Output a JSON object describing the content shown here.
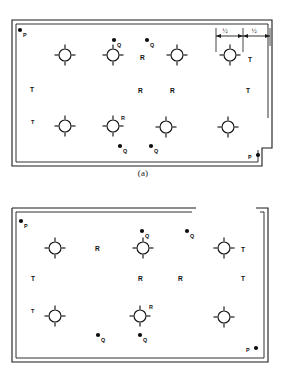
{
  "figure": {
    "panels": [
      {
        "id": "a",
        "caption": "(a)",
        "sprinkler_rows": 2,
        "sprinklers_per_row": 4,
        "wall_style": "double-line closed with bottom-right notch",
        "dimensions": [
          {
            "label": "½",
            "id": "dim-half-left"
          },
          {
            "label": "½",
            "id": "dim-half-right"
          }
        ],
        "point_labels": [
          {
            "text": "P",
            "kind": "dot-label",
            "x": 20,
            "y": 30
          },
          {
            "text": "Q",
            "kind": "dot-label",
            "x": 114,
            "y": 40
          },
          {
            "text": "Q",
            "kind": "dot-label",
            "x": 147,
            "y": 40
          },
          {
            "text": "R",
            "kind": "plain",
            "x": 140,
            "y": 58
          },
          {
            "text": "T",
            "kind": "plain",
            "x": 248,
            "y": 60
          },
          {
            "text": "T",
            "kind": "plain",
            "x": 32,
            "y": 90
          },
          {
            "text": "R",
            "kind": "plain",
            "x": 140,
            "y": 91
          },
          {
            "text": "R",
            "kind": "plain",
            "x": 172,
            "y": 91
          },
          {
            "text": "T",
            "kind": "plain",
            "x": 248,
            "y": 91
          },
          {
            "text": "T",
            "kind": "plain",
            "x": 33,
            "y": 122
          },
          {
            "text": "R",
            "kind": "plain",
            "x": 122,
            "y": 118
          },
          {
            "text": "Q",
            "kind": "dot-label",
            "x": 120,
            "y": 146
          },
          {
            "text": "Q",
            "kind": "dot-label",
            "x": 151,
            "y": 146
          },
          {
            "text": "P",
            "kind": "dot-label-right",
            "x": 252,
            "y": 158
          }
        ]
      },
      {
        "id": "b",
        "caption": "(b)",
        "sprinkler_rows": 2,
        "sprinklers_per_row": 3,
        "wall_style": "double-line with top-right doorway gap",
        "dimensions": [],
        "point_labels": [
          {
            "text": "P",
            "kind": "dot-label",
            "x": 21,
            "y": 31
          },
          {
            "text": "Q",
            "kind": "dot-label",
            "x": 145,
            "y": 41
          },
          {
            "text": "Q",
            "kind": "dot-label",
            "x": 190,
            "y": 41
          },
          {
            "text": "R",
            "kind": "plain",
            "x": 97,
            "y": 58
          },
          {
            "text": "T",
            "kind": "plain",
            "x": 243,
            "y": 60
          },
          {
            "text": "T",
            "kind": "plain",
            "x": 33,
            "y": 89
          },
          {
            "text": "R",
            "kind": "plain",
            "x": 140,
            "y": 89
          },
          {
            "text": "R",
            "kind": "plain",
            "x": 180,
            "y": 89
          },
          {
            "text": "T",
            "kind": "plain",
            "x": 243,
            "y": 89
          },
          {
            "text": "T",
            "kind": "plain",
            "x": 33,
            "y": 121
          },
          {
            "text": "R",
            "kind": "plain",
            "x": 143,
            "y": 117
          },
          {
            "text": "Q",
            "kind": "dot-label",
            "x": 100,
            "y": 145
          },
          {
            "text": "Q",
            "kind": "dot-label",
            "x": 142,
            "y": 145
          },
          {
            "text": "P",
            "kind": "dot-label-right",
            "x": 249,
            "y": 160
          }
        ]
      }
    ],
    "colors": {
      "ink": "#1b1b1b",
      "paper": "#ffffff",
      "dot": "#0d0d0d"
    },
    "legend_symbols": [
      {
        "name": "sprinkler-head",
        "description": "circle with four radiating spokes"
      },
      {
        "name": "measurement-point",
        "description": "filled dot with letter label"
      }
    ]
  }
}
